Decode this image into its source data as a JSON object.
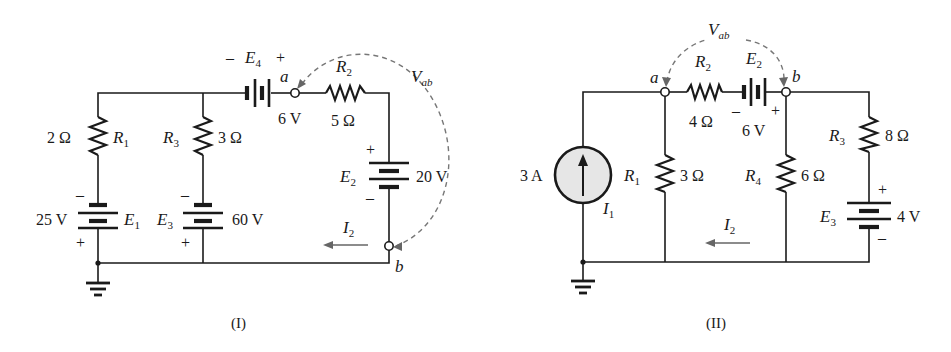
{
  "figures": [
    {
      "caption": "(I)",
      "components": {
        "E4": {
          "label": "E",
          "sub": "4",
          "value": "6 V",
          "minus": "–",
          "plus": "+"
        },
        "R2": {
          "label": "R",
          "sub": "2",
          "value": "5 Ω"
        },
        "R1": {
          "label": "R",
          "sub": "1",
          "value": "2 Ω"
        },
        "R3": {
          "label": "R",
          "sub": "3",
          "value": "3 Ω"
        },
        "E1": {
          "label": "E",
          "sub": "1",
          "value": "25 V",
          "minus": "–",
          "plus": "+"
        },
        "E3": {
          "label": "E",
          "sub": "3",
          "value": "60 V",
          "minus": "–",
          "plus": "+"
        },
        "E2": {
          "label": "E",
          "sub": "2",
          "value": "20 V",
          "minus": "–",
          "plus": "+"
        }
      },
      "nodes": {
        "a": "a",
        "b": "b"
      },
      "vab": {
        "label": "V",
        "sub": "ab"
      },
      "current": {
        "label": "I",
        "sub": "2"
      }
    },
    {
      "caption": "(II)",
      "components": {
        "I1": {
          "label": "I",
          "sub": "1",
          "value": "3 A"
        },
        "R1": {
          "label": "R",
          "sub": "1",
          "value": "3 Ω"
        },
        "R2": {
          "label": "R",
          "sub": "2",
          "value": "4 Ω"
        },
        "E2": {
          "label": "E",
          "sub": "2",
          "value": "6 V",
          "minus": "–",
          "plus": "+"
        },
        "R4": {
          "label": "R",
          "sub": "4",
          "value": "6 Ω"
        },
        "R3": {
          "label": "R",
          "sub": "3",
          "value": "8 Ω"
        },
        "E3": {
          "label": "E",
          "sub": "3",
          "value": "4 V",
          "minus": "–",
          "plus": "+"
        }
      },
      "nodes": {
        "a": "a",
        "b": "b"
      },
      "vab": {
        "label": "V",
        "sub": "ab"
      },
      "current": {
        "label": "I",
        "sub": "2"
      }
    }
  ],
  "colors": {
    "wire": "#1a1a1a",
    "annotation": "#777777",
    "source_fill": "#e6e6e6"
  }
}
